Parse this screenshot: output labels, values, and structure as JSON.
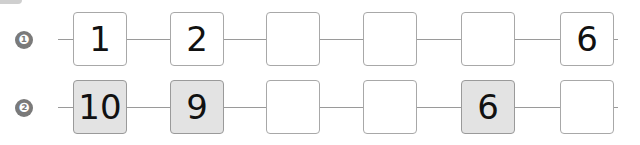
{
  "rows": [
    {
      "label": "❶",
      "cells": [
        {
          "value": "1",
          "shaded": false
        },
        {
          "value": "2",
          "shaded": false
        },
        {
          "value": "",
          "shaded": false
        },
        {
          "value": "",
          "shaded": false
        },
        {
          "value": "",
          "shaded": false
        },
        {
          "value": "6",
          "shaded": false
        }
      ]
    },
    {
      "label": "❷",
      "cells": [
        {
          "value": "10",
          "shaded": true
        },
        {
          "value": "9",
          "shaded": true
        },
        {
          "value": "",
          "shaded": false
        },
        {
          "value": "",
          "shaded": false
        },
        {
          "value": "6",
          "shaded": true
        },
        {
          "value": "",
          "shaded": false
        }
      ]
    }
  ]
}
